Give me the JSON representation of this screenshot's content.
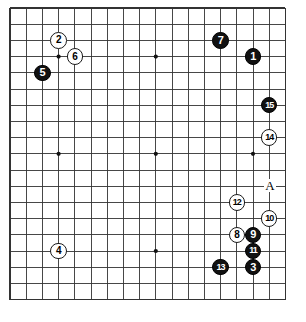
{
  "diagram": {
    "kind": "go-board-diagram",
    "board_size": 19,
    "visible_columns": 18,
    "visible_rows": 19,
    "grid": {
      "origin_x": 10,
      "origin_y": 8,
      "spacing": 16.2,
      "line_color": "#333333",
      "border_color": "#1a1a1a",
      "background": "#ffffff"
    },
    "star_points": [
      {
        "col": 3,
        "row": 3
      },
      {
        "col": 9,
        "row": 3
      },
      {
        "col": 15,
        "row": 3
      },
      {
        "col": 3,
        "row": 9
      },
      {
        "col": 9,
        "row": 9
      },
      {
        "col": 15,
        "row": 9
      },
      {
        "col": 3,
        "row": 15
      },
      {
        "col": 9,
        "row": 15
      },
      {
        "col": 15,
        "row": 15
      }
    ],
    "colors": {
      "black_stone": "#111111",
      "white_stone": "#ffffff",
      "black_text": "#ffffff",
      "white_text": "#000000"
    },
    "moves": [
      {
        "label": "1",
        "color": "black",
        "col": 15,
        "row": 3
      },
      {
        "label": "2",
        "color": "white",
        "col": 3,
        "row": 2
      },
      {
        "label": "3",
        "color": "black",
        "col": 15,
        "row": 16
      },
      {
        "label": "4",
        "color": "white",
        "col": 3,
        "row": 15
      },
      {
        "label": "5",
        "color": "black",
        "col": 2,
        "row": 4
      },
      {
        "label": "6",
        "color": "white",
        "col": 4,
        "row": 3
      },
      {
        "label": "7",
        "color": "black",
        "col": 13,
        "row": 2
      },
      {
        "label": "8",
        "color": "white",
        "col": 14,
        "row": 14
      },
      {
        "label": "9",
        "color": "black",
        "col": 15,
        "row": 14
      },
      {
        "label": "10",
        "color": "white",
        "col": 16,
        "row": 13
      },
      {
        "label": "11",
        "color": "black",
        "col": 15,
        "row": 15
      },
      {
        "label": "12",
        "color": "white",
        "col": 14,
        "row": 12
      },
      {
        "label": "13",
        "color": "black",
        "col": 13,
        "row": 16
      },
      {
        "label": "14",
        "color": "white",
        "col": 16,
        "row": 8
      },
      {
        "label": "15",
        "color": "black",
        "col": 16,
        "row": 6
      }
    ],
    "point_labels": [
      {
        "label": "A",
        "col": 16,
        "row": 11
      }
    ]
  }
}
